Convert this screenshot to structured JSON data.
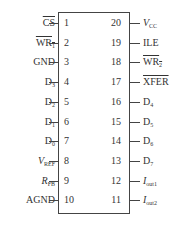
{
  "left_pins": [
    {
      "num": "1",
      "label": "CS",
      "sub": "",
      "overline": true,
      "italic": false
    },
    {
      "num": "2",
      "label": "WR",
      "sub": "1",
      "overline": true,
      "italic": false
    },
    {
      "num": "3",
      "label": "GND",
      "sub": "",
      "overline": false,
      "italic": false
    },
    {
      "num": "4",
      "label": "D",
      "sub": "3",
      "overline": false,
      "italic": false
    },
    {
      "num": "5",
      "label": "D",
      "sub": "2",
      "overline": false,
      "italic": false
    },
    {
      "num": "6",
      "label": "D",
      "sub": "1",
      "overline": false,
      "italic": false
    },
    {
      "num": "7",
      "label": "D",
      "sub": "0",
      "overline": false,
      "italic": false
    },
    {
      "num": "8",
      "label": "V",
      "sub": "REF",
      "overline": false,
      "italic": true
    },
    {
      "num": "9",
      "label": "R",
      "sub": "FB",
      "overline": false,
      "italic": true
    },
    {
      "num": "10",
      "label": "AGND",
      "sub": "",
      "overline": false,
      "italic": false
    }
  ],
  "right_pins": [
    {
      "num": "20",
      "label": "V",
      "sub": "CC",
      "overline": false,
      "italic": true
    },
    {
      "num": "19",
      "label": "ILE",
      "sub": "",
      "overline": false,
      "italic": false
    },
    {
      "num": "18",
      "label": "WR",
      "sub": "2",
      "overline": true,
      "italic": false
    },
    {
      "num": "17",
      "label": "XFER",
      "sub": "",
      "overline": true,
      "italic": false
    },
    {
      "num": "16",
      "label": "D",
      "sub": "4",
      "overline": false,
      "italic": false
    },
    {
      "num": "15",
      "label": "D",
      "sub": "5",
      "overline": false,
      "italic": false
    },
    {
      "num": "14",
      "label": "D",
      "sub": "6",
      "overline": false,
      "italic": false
    },
    {
      "num": "13",
      "label": "D",
      "sub": "7",
      "overline": false,
      "italic": false
    },
    {
      "num": "12",
      "label": "I",
      "sub": "out1",
      "overline": false,
      "italic": true
    },
    {
      "num": "11",
      "label": "I",
      "sub": "out2",
      "overline": false,
      "italic": true
    }
  ]
}
